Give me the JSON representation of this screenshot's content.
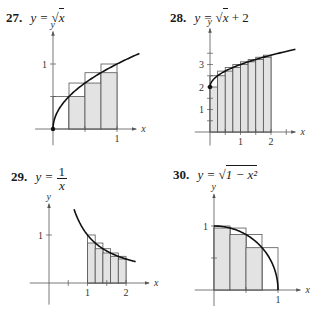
{
  "problems": [
    {
      "number": "27.",
      "lhs": "y =",
      "rhs_radical": "√",
      "rhs_radicand": "x",
      "rhs_suffix": "",
      "function": "sqrt(x)",
      "chart_data": {
        "type": "area",
        "title": "27. y = √x",
        "xlabel": "x",
        "ylabel": "y",
        "x_ticks": [
          0.5,
          1
        ],
        "x_tick_labels": [
          "",
          "1"
        ],
        "y_ticks": [
          0.5,
          1
        ],
        "y_tick_labels": [
          "",
          "1"
        ],
        "xlim": [
          -0.28,
          1.3
        ],
        "ylim": [
          -0.25,
          1.5
        ],
        "interval": [
          0,
          1
        ],
        "n_rectangles": 4,
        "lower_sum_heights": [
          0,
          0.5,
          0.707,
          0.866
        ],
        "upper_sum_heights": [
          0.5,
          0.707,
          0.866,
          1
        ],
        "curve_x_range": [
          0,
          1.35
        ],
        "marked_points": [
          [
            0,
            0
          ]
        ],
        "grid": false
      }
    },
    {
      "number": "28.",
      "lhs": "y =",
      "rhs_radical": "√",
      "rhs_radicand": "x",
      "rhs_suffix": "+ 2",
      "function": "sqrt(x)+2",
      "chart_data": {
        "type": "area",
        "title": "28. y = √x + 2",
        "xlabel": "x",
        "ylabel": "y",
        "x_ticks": [
          0.5,
          1,
          1.5,
          2,
          2.5
        ],
        "x_tick_labels": [
          "",
          "1",
          "",
          "2",
          ""
        ],
        "y_ticks": [
          0.5,
          1,
          1.5,
          2,
          2.5,
          3,
          3.5
        ],
        "y_tick_labels": [
          "",
          "1",
          "",
          "2",
          "",
          "3",
          ""
        ],
        "xlim": [
          -0.5,
          2.8
        ],
        "ylim": [
          -0.6,
          4.6
        ],
        "interval": [
          0,
          2
        ],
        "n_rectangles": 8,
        "lower_sum_heights": [
          2.0,
          2.5,
          2.707,
          2.866,
          3.0,
          3.118,
          3.225,
          3.323
        ],
        "upper_sum_heights": [
          2.5,
          2.707,
          2.866,
          3.0,
          3.118,
          3.225,
          3.323,
          3.414
        ],
        "curve_x_range": [
          0,
          2.8
        ],
        "marked_points": [
          [
            0,
            2
          ]
        ],
        "grid": false
      }
    },
    {
      "number": "29.",
      "lhs": "y =",
      "frac_num": "1",
      "frac_den": "x",
      "function": "1/x",
      "chart_data": {
        "type": "area",
        "title": "29. y = 1/x",
        "xlabel": "x",
        "ylabel": "y",
        "x_ticks": [
          0.5,
          1,
          1.5,
          2
        ],
        "x_tick_labels": [
          "",
          "1",
          "",
          "2"
        ],
        "y_ticks": [
          1
        ],
        "y_tick_labels": [
          "1"
        ],
        "xlim": [
          -0.5,
          2.6
        ],
        "ylim": [
          -0.45,
          1.65
        ],
        "interval": [
          1,
          2
        ],
        "n_rectangles": 5,
        "lower_sum_heights": [
          0.833,
          0.714,
          0.625,
          0.556,
          0.5
        ],
        "upper_sum_heights": [
          1.0,
          0.833,
          0.714,
          0.625,
          0.556
        ],
        "curve_x_range": [
          0.65,
          2.25
        ],
        "marked_points": [],
        "grid": false
      }
    },
    {
      "number": "30.",
      "lhs": "y =",
      "rhs_radical": "√",
      "rhs_radicand": "1 − x²",
      "rhs_suffix": "",
      "function": "sqrt(1-x^2)",
      "chart_data": {
        "type": "area",
        "title": "30. y = √(1 − x²)",
        "xlabel": "x",
        "ylabel": "y",
        "x_ticks": [
          0.5,
          1
        ],
        "x_tick_labels": [
          "",
          "1"
        ],
        "y_ticks": [
          0.5,
          1
        ],
        "y_tick_labels": [
          "",
          "1"
        ],
        "xlim": [
          -0.3,
          1.35
        ],
        "ylim": [
          -0.25,
          1.5
        ],
        "interval": [
          0,
          1
        ],
        "n_rectangles": 4,
        "lower_sum_heights": [
          0.968,
          0.866,
          0.661,
          0
        ],
        "upper_sum_heights": [
          1.0,
          0.968,
          0.866,
          0.661
        ],
        "curve_x_range": [
          0,
          1
        ],
        "marked_points": [],
        "grid": false
      }
    }
  ],
  "axis_labels": {
    "x": "x",
    "y": "y"
  },
  "colors": {
    "fill": "#e3e3e3",
    "rect_stroke": "#555555",
    "curve": "#111111",
    "axis": "#555555",
    "text": "#1a1a1a"
  }
}
